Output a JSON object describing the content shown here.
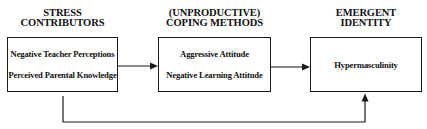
{
  "diagram": {
    "columns": [
      {
        "id": "stress-contributors",
        "header": [
          "STRESS",
          "CONTRIBUTORS"
        ],
        "items": [
          "Negative Teacher Perceptions",
          "Perceived Parental Knowledge"
        ]
      },
      {
        "id": "coping-methods",
        "header": [
          "(UNPRODUCTIVE)",
          "COPING METHODS"
        ],
        "items": [
          "Aggressive Attitude",
          "Negative Learning Attitude"
        ]
      },
      {
        "id": "emergent-identity",
        "header": [
          "EMERGENT",
          "IDENTITY"
        ],
        "items": [
          "Hypermasculinity"
        ]
      }
    ],
    "edges": [
      {
        "from": "stress-contributors",
        "to": "coping-methods",
        "type": "direct-arrow"
      },
      {
        "from": "coping-methods",
        "to": "emergent-identity",
        "type": "direct-arrow"
      },
      {
        "from": "stress-contributors",
        "to": "emergent-identity",
        "type": "bypass-arrow-below"
      }
    ],
    "colors": {
      "line": "#1a1a1a",
      "background": "#ffffff"
    }
  }
}
